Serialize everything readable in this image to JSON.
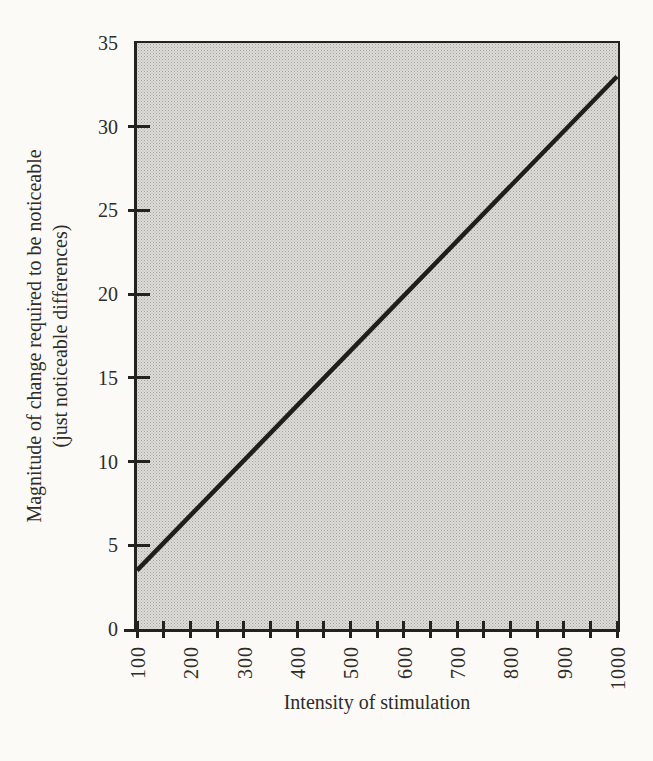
{
  "chart_data": {
    "type": "line",
    "title": "",
    "xlabel": "Intensity of stimulation",
    "ylabel": "Magnitude of change required to be noticeable (just noticeable differences)",
    "ylabel_lines": [
      "Magnitude of change required to be noticeable",
      "(just noticeable differences)"
    ],
    "xlim": [
      100,
      1000
    ],
    "ylim": [
      0,
      35
    ],
    "x_ticks": [
      100,
      200,
      300,
      400,
      500,
      600,
      700,
      800,
      900,
      1000
    ],
    "x_minor_ticks": [
      150,
      250,
      350,
      450,
      550,
      650,
      750,
      850,
      950
    ],
    "y_ticks": [
      0,
      5,
      10,
      15,
      20,
      25,
      30,
      35
    ],
    "grid": false,
    "legend": null,
    "series": [
      {
        "name": "just noticeable difference",
        "x": [
          100,
          1000
        ],
        "y": [
          3.5,
          33
        ]
      }
    ],
    "colors": {
      "line": "#1f1e1a",
      "axis": "#23221e",
      "plot_background": "#d3d2ce",
      "page_background": "#fbfaf7",
      "text": "#2e2c27"
    }
  }
}
